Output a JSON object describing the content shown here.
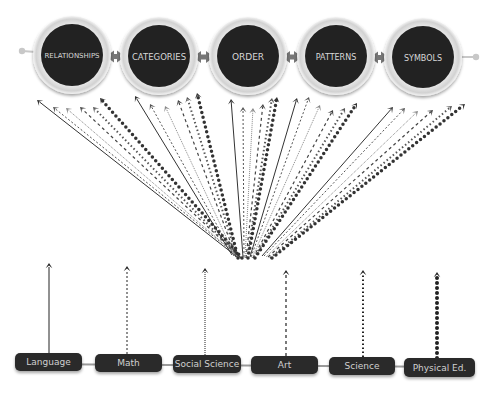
{
  "concepts": [
    {
      "label": "RELATIONSHIPS",
      "cx": 72,
      "cy": 55,
      "font_size": 7
    },
    {
      "label": "CATEGORIES",
      "cx": 159,
      "cy": 56,
      "font_size": 8.5
    },
    {
      "label": "ORDER",
      "cx": 248,
      "cy": 56,
      "font_size": 9
    },
    {
      "label": "PATTERNS",
      "cx": 336,
      "cy": 56,
      "font_size": 8
    },
    {
      "label": "SYMBOLS",
      "cx": 423,
      "cy": 57,
      "font_size": 8
    }
  ],
  "subjects": [
    {
      "label": "Language",
      "x": 15,
      "y": 353,
      "w": 67,
      "h": 18,
      "arrow_x": 49,
      "arrow_top": 263,
      "dash": "none",
      "stroke_width": 1
    },
    {
      "label": "Math",
      "x": 95,
      "y": 354,
      "w": 67,
      "h": 18,
      "arrow_x": 127,
      "arrow_top": 266,
      "dash": "2,2",
      "stroke_width": 1
    },
    {
      "label": "Social Science",
      "x": 173,
      "y": 355,
      "w": 68,
      "h": 18,
      "arrow_x": 205,
      "arrow_top": 268,
      "dash": "1,1",
      "stroke_width": 1
    },
    {
      "label": "Art",
      "x": 251,
      "y": 356,
      "w": 67,
      "h": 18,
      "arrow_x": 286,
      "arrow_top": 270,
      "dash": "3,3",
      "stroke_width": 1.2
    },
    {
      "label": "Science",
      "x": 329,
      "y": 357,
      "w": 66,
      "h": 18,
      "arrow_x": 363,
      "arrow_top": 270,
      "dash": "1.5,2.5",
      "stroke_width": 2
    },
    {
      "label": "Physical Ed.",
      "x": 404,
      "y": 358,
      "w": 71,
      "h": 19,
      "arrow_x": 437,
      "arrow_top": 272,
      "dash": "0,5",
      "stroke_width": 4
    }
  ],
  "colors": {
    "circle_fill": "#222222",
    "circle_ring": "#e3e3e3",
    "connector": "#777777",
    "box_fill": "#2b2b2b",
    "arrow": "#222222"
  },
  "fan_arrows": {
    "origin_y": 257,
    "styles": [
      {
        "dash": "none",
        "stroke_width": 1,
        "color": "#333333"
      },
      {
        "dash": "2,2",
        "stroke_width": 1,
        "color": "#555555"
      },
      {
        "dash": "1,1",
        "stroke_width": 1,
        "color": "#888888"
      },
      {
        "dash": "3,3",
        "stroke_width": 1.2,
        "color": "#444444"
      },
      {
        "dash": "1.5,2.5",
        "stroke_width": 2,
        "color": "#555555"
      },
      {
        "dash": "0,5",
        "stroke_width": 3.5,
        "color": "#333333"
      }
    ],
    "groups": [
      {
        "tips": [
          [
            37,
            100
          ],
          [
            53,
            107
          ],
          [
            66,
            108
          ],
          [
            80,
            107
          ],
          [
            93,
            107
          ],
          [
            100,
            98
          ]
        ],
        "origins": [
          [
            236,
            256
          ],
          [
            238,
            256
          ],
          [
            239,
            257
          ],
          [
            240,
            257
          ],
          [
            241,
            258
          ],
          [
            242,
            258
          ]
        ]
      },
      {
        "tips": [
          [
            135,
            96
          ],
          [
            150,
            104
          ],
          [
            165,
            106
          ],
          [
            178,
            100
          ],
          [
            187,
            97
          ],
          [
            197,
            93
          ]
        ],
        "origins": [
          [
            232,
            255
          ],
          [
            234,
            256
          ],
          [
            235,
            256
          ],
          [
            236,
            257
          ],
          [
            237,
            257
          ],
          [
            238,
            258
          ]
        ]
      },
      {
        "tips": [
          [
            231,
            99
          ],
          [
            243,
            107
          ],
          [
            253,
            108
          ],
          [
            263,
            104
          ],
          [
            272,
            98
          ],
          [
            277,
            97
          ]
        ],
        "origins": [
          [
            243,
            257
          ],
          [
            244,
            257
          ],
          [
            245,
            258
          ],
          [
            246,
            258
          ],
          [
            247,
            258
          ],
          [
            248,
            258
          ]
        ]
      },
      {
        "tips": [
          [
            297,
            98
          ],
          [
            309,
            97
          ],
          [
            320,
            105
          ],
          [
            333,
            110
          ],
          [
            345,
            108
          ],
          [
            357,
            103
          ]
        ],
        "origins": [
          [
            250,
            257
          ],
          [
            251,
            257
          ],
          [
            252,
            258
          ],
          [
            253,
            258
          ],
          [
            254,
            258
          ],
          [
            255,
            258
          ]
        ]
      },
      {
        "tips": [
          [
            393,
            107
          ],
          [
            405,
            108
          ],
          [
            418,
            111
          ],
          [
            433,
            110
          ],
          [
            452,
            106
          ],
          [
            465,
            104
          ]
        ],
        "origins": [
          [
            262,
            256
          ],
          [
            264,
            256
          ],
          [
            266,
            257
          ],
          [
            268,
            257
          ],
          [
            270,
            258
          ],
          [
            272,
            258
          ]
        ]
      }
    ]
  }
}
